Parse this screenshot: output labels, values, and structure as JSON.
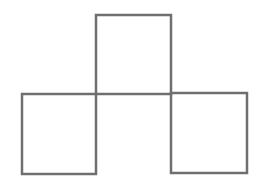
{
  "diagram": {
    "type": "matchstick-squares",
    "square_count": 3,
    "stroke_color": "#6f6f6f",
    "stroke_width": 2.5,
    "background": "#ffffff",
    "squares": [
      {
        "name": "top-square",
        "x": 96,
        "y": 15,
        "w": 75,
        "h": 79
      },
      {
        "name": "left-square",
        "x": 22,
        "y": 94,
        "w": 74,
        "h": 80
      },
      {
        "name": "right-square",
        "x": 171,
        "y": 93,
        "w": 76,
        "h": 80
      }
    ]
  }
}
